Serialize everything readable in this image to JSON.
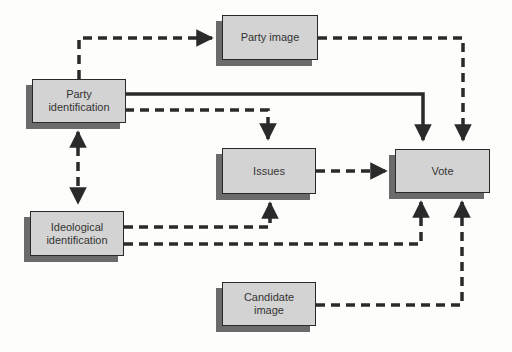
{
  "diagram": {
    "type": "flow",
    "title": "",
    "nodes": [
      {
        "id": "party_identification",
        "label_line1": "Party",
        "label_line2": "identification"
      },
      {
        "id": "party_image",
        "label_line1": "Party image",
        "label_line2": ""
      },
      {
        "id": "issues",
        "label_line1": "Issues",
        "label_line2": ""
      },
      {
        "id": "vote",
        "label_line1": "Vote",
        "label_line2": ""
      },
      {
        "id": "ideological_identification",
        "label_line1": "Ideological",
        "label_line2": "identification"
      },
      {
        "id": "candidate_image",
        "label_line1": "Candidate",
        "label_line2": "image"
      }
    ],
    "edges": [
      {
        "from": "party_identification",
        "to": "party_image",
        "style": "dashed"
      },
      {
        "from": "party_identification",
        "to": "vote",
        "style": "solid"
      },
      {
        "from": "party_identification",
        "to": "issues",
        "style": "dashed"
      },
      {
        "from": "party_image",
        "to": "vote",
        "style": "dashed"
      },
      {
        "from": "issues",
        "to": "vote",
        "style": "dashed"
      },
      {
        "from": "party_identification",
        "to": "ideological_identification",
        "style": "dashed",
        "bidirectional": true
      },
      {
        "from": "ideological_identification",
        "to": "issues",
        "style": "dashed"
      },
      {
        "from": "ideological_identification",
        "to": "vote",
        "style": "dashed"
      },
      {
        "from": "candidate_image",
        "to": "vote",
        "style": "dashed"
      }
    ],
    "colors": {
      "node_fill": "#d3d3d3",
      "node_shadow": "#6b6b6b",
      "line": "#2a2a2a",
      "background": "#fdfdfb"
    }
  }
}
